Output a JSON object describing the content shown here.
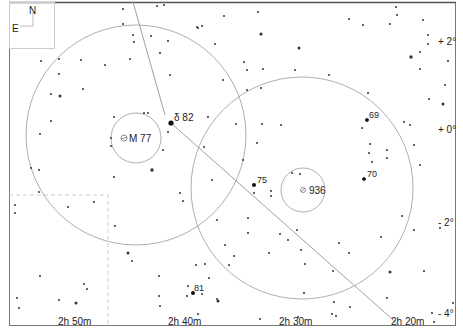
{
  "map": {
    "orientation": {
      "north": "N",
      "east": "E"
    },
    "ra_labels": [
      {
        "text": "2h 50m",
        "x": 75
      },
      {
        "text": "2h 40m",
        "x": 185
      },
      {
        "text": "2h 30m",
        "x": 297
      },
      {
        "text": "2h 20m",
        "x": 408
      }
    ],
    "dec_labels": [
      {
        "text": "+ 2°",
        "y": 45
      },
      {
        "text": "+ 0°",
        "y": 133
      },
      {
        "text": "- 2°",
        "y": 226
      },
      {
        "text": "- 4°",
        "y": 315
      }
    ],
    "objects": [
      {
        "name": "M 77",
        "x": 136,
        "y": 138,
        "symbol": "galaxy"
      },
      {
        "name": "936",
        "x": 303,
        "y": 190,
        "symbol": "galaxy"
      }
    ],
    "star_labels": [
      {
        "text": "δ 82",
        "x": 172,
        "y": 122
      },
      {
        "text": "69",
        "x": 369,
        "y": 119
      },
      {
        "text": "70",
        "x": 367,
        "y": 177
      },
      {
        "text": "75",
        "x": 257,
        "y": 183
      },
      {
        "text": "81",
        "x": 193,
        "y": 291
      }
    ]
  }
}
